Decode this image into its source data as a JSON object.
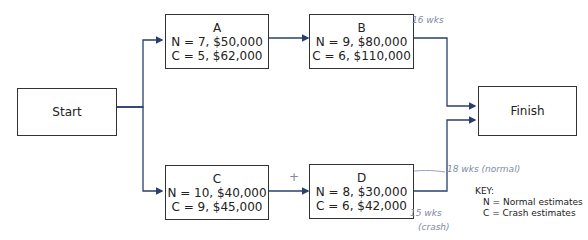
{
  "nodes": {
    "start": {
      "label": "Start"
    },
    "finish": {
      "label": "Finish"
    },
    "A": {
      "name": "A",
      "normal": "N =  7, $50,000",
      "crash": "C =  5, $62,000"
    },
    "B": {
      "name": "B",
      "normal": "N = 9,   $80,000",
      "crash": "C = 6, $110,000"
    },
    "C": {
      "name": "C",
      "normal": "N = 10, $40,000",
      "crash": "C =  9, $45,000"
    },
    "D": {
      "name": "D",
      "normal": "N = 8, $30,000",
      "crash": "C = 6, $42,000"
    }
  },
  "annotations": {
    "b_note": "16 wks",
    "d_normal_note": "18 wks (normal)",
    "d_crash_note": "15 wks",
    "d_crash_sub": "(crash)",
    "plus": "+"
  },
  "key": {
    "title": "KEY:",
    "n": "N = Normal estimates",
    "c": "C = Crash estimates"
  },
  "colors": {
    "arrow": "#2a3f6e",
    "border": "#333333",
    "handwriting": "#7d8aa6"
  }
}
